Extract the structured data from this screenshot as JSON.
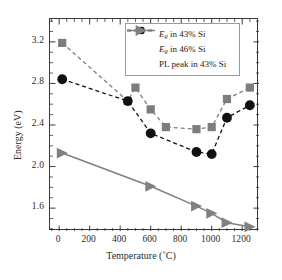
{
  "chart_data": {
    "type": "line",
    "title": "",
    "xlabel": "Temperature (˚C)",
    "ylabel": "Energy (eV)",
    "xlim": [
      -60,
      1310
    ],
    "ylim": [
      1.38,
      3.42
    ],
    "xticks": [
      0,
      200,
      400,
      600,
      800,
      1000,
      1200
    ],
    "yticks": [
      1.6,
      2.0,
      2.4,
      2.8,
      3.2
    ],
    "xtick_labels": [
      "0",
      "200",
      "400",
      "600",
      "800",
      "1000",
      "1200"
    ],
    "ytick_labels": [
      "1.6",
      "2.0",
      "2.4",
      "2.8",
      "3.2"
    ],
    "grid": false,
    "legend_position": "upper right",
    "series": [
      {
        "name": "Eg in 43% Si",
        "marker": "square",
        "color": "#7d7d7d",
        "linestyle": "dashed",
        "x": [
          20,
          450,
          500,
          600,
          700,
          900,
          1000,
          1100,
          1250
        ],
        "y": [
          3.19,
          2.63,
          2.76,
          2.55,
          2.38,
          2.36,
          2.38,
          2.65,
          2.76
        ]
      },
      {
        "name": "Eg in 46% Si",
        "marker": "circle",
        "color": "#111111",
        "linestyle": "dashed",
        "x": [
          20,
          450,
          600,
          900,
          1000,
          1100,
          1250
        ],
        "y": [
          2.84,
          2.63,
          2.32,
          2.14,
          2.12,
          2.47,
          2.59
        ]
      },
      {
        "name": "PL peak in 43% Si",
        "marker": "triangle-right",
        "color": "#808080",
        "linestyle": "solid",
        "x": [
          20,
          600,
          900,
          1000,
          1100,
          1250
        ],
        "y": [
          2.13,
          1.81,
          1.62,
          1.55,
          1.46,
          1.42
        ]
      }
    ]
  },
  "legend": {
    "items": [
      {
        "prefix": "E",
        "subscript": "g",
        "suffix": " in 43% Si",
        "symbol": "square-dashed"
      },
      {
        "prefix": "E",
        "subscript": "g",
        "suffix": " in 46% Si",
        "symbol": "circle-dashed"
      },
      {
        "prefix": "PL peak",
        "subscript": "",
        "suffix": " in 43% Si",
        "symbol": "triangle-solid"
      }
    ]
  },
  "axes": {
    "y_title": "Energy (eV)",
    "x_title": "Temperature (˚C)"
  },
  "colors": {
    "gray_series": "#7d7d7d",
    "black_series": "#111111",
    "pl_series": "#808080",
    "frame": "#3a3a3a",
    "legend_border": "#9a9a9a"
  }
}
